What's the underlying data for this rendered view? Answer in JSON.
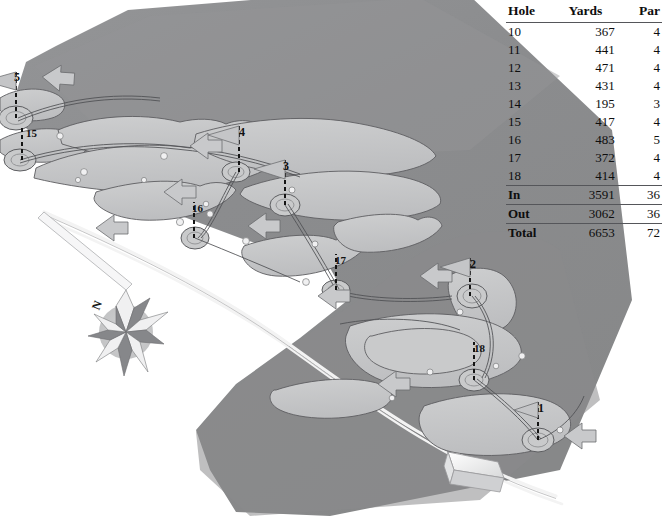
{
  "page": {
    "background_color": "#ffffff"
  },
  "scorecard": {
    "name": "golf-scorecard",
    "headers": [
      "Hole",
      "Yards",
      "Par"
    ],
    "rows": [
      {
        "hole": "10",
        "yards": "367",
        "par": "4"
      },
      {
        "hole": "11",
        "yards": "441",
        "par": "4"
      },
      {
        "hole": "12",
        "yards": "471",
        "par": "4"
      },
      {
        "hole": "13",
        "yards": "431",
        "par": "4"
      },
      {
        "hole": "14",
        "yards": "195",
        "par": "3"
      },
      {
        "hole": "15",
        "yards": "417",
        "par": "4"
      },
      {
        "hole": "16",
        "yards": "483",
        "par": "5"
      },
      {
        "hole": "17",
        "yards": "372",
        "par": "4"
      },
      {
        "hole": "18",
        "yards": "414",
        "par": "4"
      }
    ],
    "summary": [
      {
        "hole": "In",
        "yards": "3591",
        "par": "36"
      },
      {
        "hole": "Out",
        "yards": "3062",
        "par": "36"
      },
      {
        "hole": "Total",
        "yards": "6653",
        "par": "72"
      }
    ]
  },
  "map": {
    "name": "course-map",
    "compass_label": "N",
    "colors": {
      "land": "#8b8c8e",
      "land_light": "#97989a",
      "fairway": "#c3c4c6",
      "green": "#c9cacb",
      "bunker": "#f2f2f2",
      "path": "#f4f4f4",
      "outline": "#5a5b5e",
      "flag": "#bfc0c2",
      "building": "#fbfbfb",
      "text": "#111111"
    },
    "hole_markers": [
      {
        "label": "5",
        "x": 14,
        "y": 78,
        "flag": true
      },
      {
        "label": "15",
        "x": 26,
        "y": 132,
        "flag": false
      },
      {
        "label": "4",
        "x": 239,
        "y": 131,
        "flag": true
      },
      {
        "label": "3",
        "x": 283,
        "y": 165,
        "flag": true
      },
      {
        "label": "16",
        "x": 192,
        "y": 207,
        "flag": false
      },
      {
        "label": "17",
        "x": 335,
        "y": 259,
        "flag": false
      },
      {
        "label": "2",
        "x": 470,
        "y": 265,
        "flag": true
      },
      {
        "label": "18",
        "x": 474,
        "y": 348,
        "flag": false
      },
      {
        "label": "1",
        "x": 538,
        "y": 410,
        "flag": true
      }
    ]
  }
}
